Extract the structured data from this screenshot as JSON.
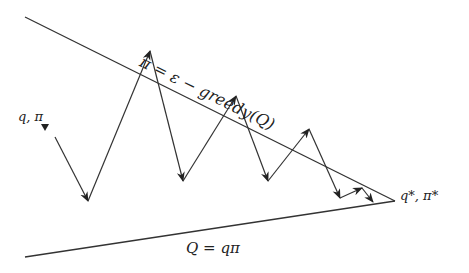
{
  "diagram": {
    "labels": {
      "top_line": "π = ε − greedy(Q)",
      "bottom_line": "Q = q_π",
      "bottom_line_display": "Q = qπ",
      "start": "q, π",
      "end": "q*, π*"
    },
    "lines": {
      "top": {
        "from": [
          25,
          17
        ],
        "to": [
          395,
          201
        ]
      },
      "bottom": {
        "from": [
          25,
          257
        ],
        "to": [
          395,
          201
        ]
      }
    },
    "zigzag_points": [
      [
        55,
        137
      ],
      [
        88,
        201
      ],
      [
        150,
        51
      ],
      [
        183,
        181
      ],
      [
        236,
        96
      ],
      [
        268,
        181
      ],
      [
        309,
        129
      ],
      [
        340,
        198
      ],
      [
        362,
        188
      ],
      [
        373,
        202
      ]
    ],
    "colors": {
      "stroke": "#333333",
      "text": "#222222",
      "background": "#ffffff"
    }
  }
}
